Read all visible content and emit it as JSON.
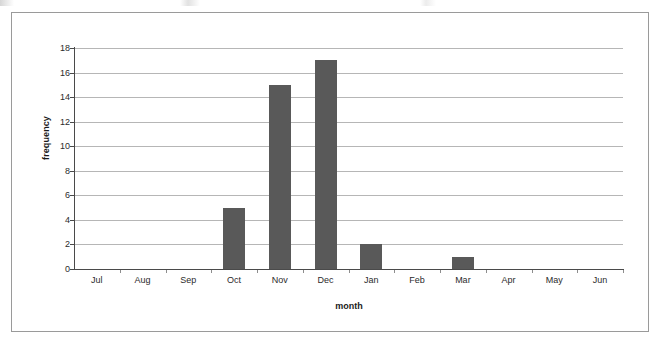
{
  "figure": {
    "border_color": "#9a9a9a",
    "background": "#ffffff"
  },
  "chart_data": {
    "type": "bar",
    "title": "",
    "subtitle": "",
    "xlabel": "month",
    "ylabel": "frequency",
    "categories": [
      "Jul",
      "Aug",
      "Sep",
      "Oct",
      "Nov",
      "Dec",
      "Jan",
      "Feb",
      "Mar",
      "Apr",
      "May",
      "Jun"
    ],
    "values": [
      0,
      0,
      0,
      5,
      15,
      17,
      2,
      0,
      1,
      0,
      0,
      0
    ],
    "ylim": [
      0,
      18
    ],
    "ytick_step": 2,
    "ytick_labels": [
      "0",
      "2",
      "4",
      "6",
      "8",
      "10",
      "12",
      "14",
      "16",
      "18"
    ],
    "grid": "horizontal",
    "legend": "none",
    "bar_color": "#595959",
    "gridline_color": "#b6b6b6",
    "axis_color": "#4a4a4a"
  }
}
